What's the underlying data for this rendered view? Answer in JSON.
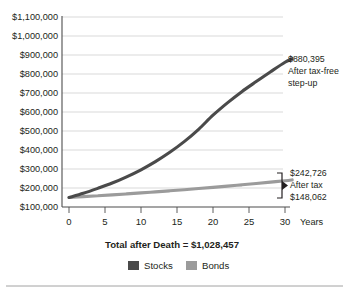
{
  "chart_data": {
    "type": "line",
    "title": "",
    "xlabel": "Years",
    "ylabel": "",
    "xlim": [
      0,
      32
    ],
    "ylim": [
      100000,
      1100000
    ],
    "grid": true,
    "legend_position": "bottom",
    "x": [
      0,
      5,
      10,
      15,
      20,
      25,
      30
    ],
    "ytick_labels": [
      "$1,100,000",
      "$1,000,000",
      "$900,000",
      "$800,000",
      "$700,000",
      "$600,000",
      "$500,000",
      "$400,000",
      "$300,000",
      "$200,000",
      "$100,000"
    ],
    "ytick_values": [
      1100000,
      1000000,
      900000,
      800000,
      700000,
      600000,
      500000,
      400000,
      300000,
      200000,
      100000
    ],
    "xtick_labels": [
      "0",
      "5",
      "10",
      "15",
      "20",
      "25",
      "30"
    ],
    "xtick_values": [
      0,
      5,
      10,
      15,
      20,
      25,
      30
    ],
    "series": [
      {
        "name": "Stocks",
        "color": "#4a4a4a",
        "end_value": 880395,
        "values": [
          150000,
          196000,
          258000,
          338000,
          443000,
          595000,
          820000
        ],
        "dense_x": [
          0,
          2,
          4,
          6,
          8,
          10,
          12,
          14,
          16,
          18,
          20,
          22,
          24,
          26,
          28,
          30,
          31
        ],
        "dense_values": [
          150000,
          172000,
          198000,
          226000,
          259000,
          296000,
          339000,
          388000,
          444000,
          509000,
          583000,
          648000,
          707000,
          760000,
          812000,
          862000,
          880395
        ]
      },
      {
        "name": "Bonds",
        "color": "#9b9b9b",
        "end_value": 242726,
        "values": [
          150000,
          162000,
          175000,
          189000,
          203000,
          219000,
          236000
        ],
        "dense_x": [
          0,
          2,
          4,
          6,
          8,
          10,
          12,
          14,
          16,
          18,
          20,
          22,
          24,
          26,
          28,
          30,
          31
        ],
        "dense_values": [
          150000,
          154500,
          159200,
          164000,
          169000,
          174200,
          179600,
          185200,
          191000,
          197000,
          203300,
          209800,
          216600,
          223600,
          230900,
          238500,
          242726
        ]
      }
    ],
    "annotations": [
      {
        "id": "stocks-annotation",
        "amount": "$880,395",
        "line2": "After tax-free",
        "line3": "step-up"
      },
      {
        "id": "bonds-annotation",
        "amount": "$242,726",
        "line2": "After tax",
        "line3": "$148,062"
      }
    ],
    "caption": "Total after Death = $1,028,457",
    "legend": [
      {
        "label": "Stocks",
        "color": "#4a4a4a"
      },
      {
        "label": "Bonds",
        "color": "#9b9b9b"
      }
    ]
  }
}
